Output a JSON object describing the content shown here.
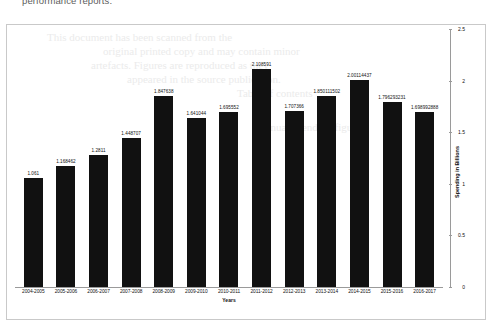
{
  "page": {
    "heading_fragment": "performance reports."
  },
  "watermark_lines": [
    "This document has been scanned from the",
    "original printed copy and may contain minor",
    "artefacts. Figures are reproduced as they",
    "appeared in the source publication.",
    "Table of contents",
    "Annual spending figures"
  ],
  "chart_data": {
    "type": "bar",
    "title": "",
    "xlabel": "Years",
    "ylabel": "Spending in Billions",
    "ylim": [
      0,
      2.5
    ],
    "yticks": [
      "0",
      "0.5",
      "1",
      "1.5",
      "2",
      "2.5"
    ],
    "grid": false,
    "legend": "none",
    "bar_color": "#111111",
    "categories": [
      "2004-2005",
      "2005-2006",
      "2006-2007",
      "2007-2008",
      "2008-2009",
      "2009-2010",
      "2010-2011",
      "2011-2012",
      "2012-2013",
      "2013-2014",
      "2014-2015",
      "2015-2016",
      "2016-2017"
    ],
    "values": [
      1.061,
      1.168462,
      1.2811,
      1.448707,
      1.847638,
      1.641044,
      1.695552,
      2.108591,
      1.707366,
      1.850111502,
      2.00114437,
      1.796293231,
      1.698992888
    ],
    "data_labels": [
      "1.061",
      "1.168462",
      "1.2811",
      "1.448707",
      "1.847638",
      "1.641044",
      "1.695552",
      "2.108591",
      "1.707366",
      "1.850111502",
      "2.00114437",
      "1.796293231",
      "1.698992888"
    ]
  }
}
